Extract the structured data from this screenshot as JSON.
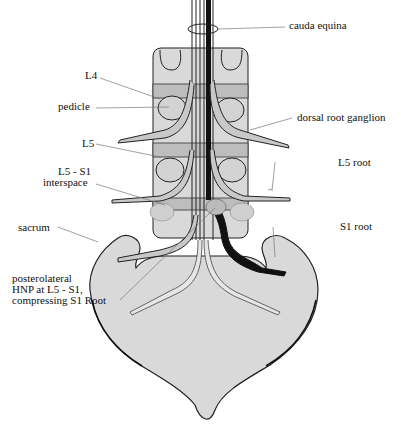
{
  "diagram": {
    "colors": {
      "bone": "#d9d9d9",
      "disc": "#bdbdbd",
      "outline": "#222222",
      "nerve": "#c8c8c8",
      "compressed_root": "#111111",
      "leader": "#777777"
    },
    "labels": {
      "cauda_equina": "cauda equina",
      "l4": "L4",
      "pedicle": "pedicle",
      "dorsal_root_ganglion": "dorsal root ganglion",
      "l5": "L5",
      "l5_root": "L5 root",
      "l5_s1_line1": "L5 - S1",
      "l5_s1_line2": "interspace",
      "sacrum": "sacrum",
      "s1_root": "S1 root",
      "hnp_line1": "posterolateral",
      "hnp_line2": "HNP at L5 - S1,",
      "hnp_line3": "compressing S1 Root"
    }
  }
}
